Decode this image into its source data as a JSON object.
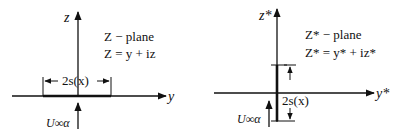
{
  "left_panel": {
    "vertical_axis_label": "z",
    "horizontal_axis_label": "y",
    "plane_title": "Z − plane",
    "plane_equation": "Z = y + iz",
    "span_label": "2s(x)",
    "flow_label": "U∞α"
  },
  "right_panel": {
    "vertical_axis_label": "z*",
    "horizontal_axis_label": "y*",
    "plane_title": "Z* − plane",
    "plane_equation": "Z* = y* + iz*",
    "span_label": "2s(x)",
    "flow_label": "U∞α"
  },
  "colors": {
    "ink": "#111111",
    "background": "#ffffff"
  }
}
